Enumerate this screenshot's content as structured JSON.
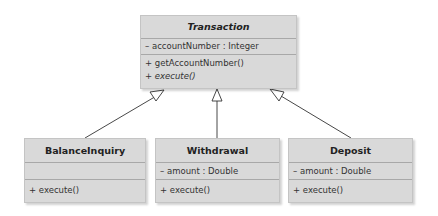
{
  "diagram_type": "uml-class-generalization",
  "classes": {
    "transaction": {
      "name": "Transaction",
      "name_style": "bold-italic",
      "attributes": [
        "– accountNumber : Integer"
      ],
      "operations": [
        "+ getAccountNumber()",
        "+ execute()"
      ]
    },
    "balance_inquiry": {
      "name": "BalanceInquiry",
      "attributes": [],
      "operations": [
        "+ execute()"
      ]
    },
    "withdrawal": {
      "name": "Withdrawal",
      "attributes": [
        "– amount : Double"
      ],
      "operations": [
        "+ execute()"
      ]
    },
    "deposit": {
      "name": "Deposit",
      "attributes": [
        "– amount : Double"
      ],
      "operations": [
        "+ execute()"
      ]
    }
  },
  "relationships": [
    {
      "type": "generalization",
      "from": "BalanceInquiry",
      "to": "Transaction"
    },
    {
      "type": "generalization",
      "from": "Withdrawal",
      "to": "Transaction"
    },
    {
      "type": "generalization",
      "from": "Deposit",
      "to": "Transaction"
    }
  ],
  "colors": {
    "box_fill": "#d9d9d9",
    "box_border": "#c4c4c4",
    "divider": "#a8a8a8",
    "edge": "#333333"
  }
}
